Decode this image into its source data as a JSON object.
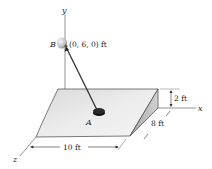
{
  "diagram": {
    "axes": {
      "x_label": "x",
      "y_label": "y",
      "z_label": "z"
    },
    "points": {
      "B": {
        "label": "B",
        "coordinates": "(0, 6, 0) ft"
      },
      "A": {
        "label": "A"
      }
    },
    "dimensions": {
      "height": "2 ft",
      "depth": "8 ft",
      "width": "10 ft"
    },
    "colors": {
      "plate_top": "#e6e6e6",
      "plate_side": "#bdbdbd",
      "cable": "#333333",
      "puck": "#1a1a1a",
      "sphere": "#cfcfcf",
      "lines": "#555555"
    }
  }
}
